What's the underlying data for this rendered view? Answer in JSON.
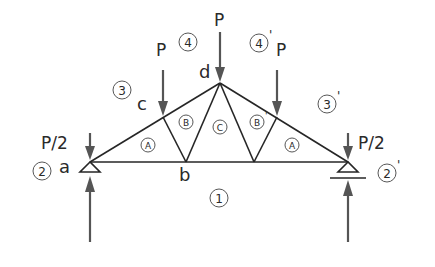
{
  "diagram": {
    "title": "",
    "type": "roof truss free-body diagram",
    "loads": {
      "left_end": "P/2",
      "right_end": "P/2",
      "left_panel": "P",
      "apex": "P",
      "right_panel": "P"
    },
    "nodes": {
      "a": "a",
      "b": "b",
      "c": "c",
      "d": "d"
    },
    "zones": {
      "z1": "1",
      "z2": "2",
      "z2p": "2",
      "z2p_prime": "'",
      "z3": "3",
      "z3p": "3",
      "z3p_prime": "'",
      "z4": "4",
      "z4p": "4",
      "z4p_prime": "'"
    },
    "panels": {
      "A_left": "A",
      "B_left": "B",
      "C": "C",
      "B_right": "B",
      "B_right_prime": "'",
      "A_right": "A"
    },
    "colors": {
      "member": "#262626",
      "arrow": "#555555",
      "text": "#2a2a2a"
    }
  }
}
